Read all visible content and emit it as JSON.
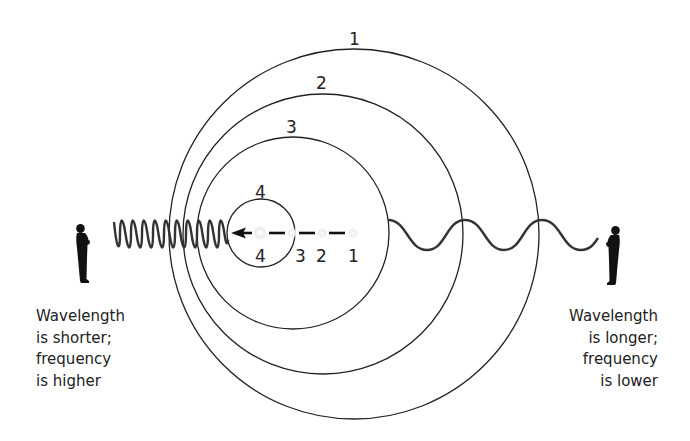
{
  "diagram": {
    "colors": {
      "stroke": "#222222",
      "background": "#ffffff",
      "source_glow": "#e6e6e6"
    },
    "wavefronts": [
      {
        "label": "1",
        "cx": 354,
        "cy": 234,
        "r": 185
      },
      {
        "label": "2",
        "cx": 323,
        "cy": 234,
        "r": 140
      },
      {
        "label": "3",
        "cx": 293,
        "cy": 233,
        "r": 96
      },
      {
        "label": "4",
        "cx": 261,
        "cy": 233,
        "r": 34
      }
    ],
    "source_positions": [
      {
        "label": "1",
        "x": 353
      },
      {
        "label": "2",
        "x": 322
      },
      {
        "label": "3",
        "x": 292
      },
      {
        "label": "4",
        "x": 260
      }
    ],
    "motion_direction": "left",
    "left_wave": {
      "description": "compressed wave",
      "cycles": 10
    },
    "right_wave": {
      "description": "stretched wave",
      "cycles": 2.75
    }
  },
  "labels": {
    "wavefront_1": "1",
    "wavefront_2": "2",
    "wavefront_3": "3",
    "wavefront_4_top": "4",
    "wavefront_4_bottom": "4",
    "position_3": "3",
    "position_2": "2",
    "position_1": "1"
  },
  "observers": {
    "left": {
      "icon": "person-silhouette-icon",
      "caption": [
        "Wavelength",
        "is shorter;",
        "frequency",
        "is higher"
      ]
    },
    "right": {
      "icon": "person-silhouette-icon",
      "caption": [
        "Wavelength",
        "is longer;",
        "frequency",
        "is lower"
      ]
    }
  }
}
